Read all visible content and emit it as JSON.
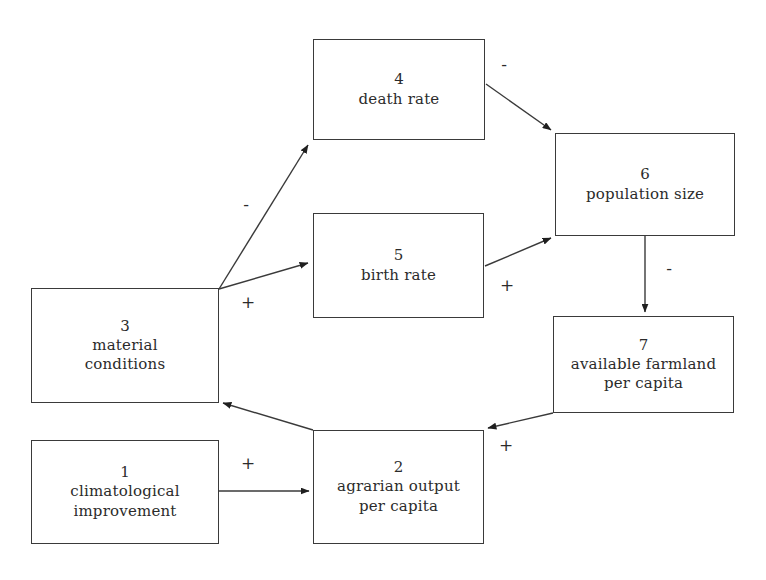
{
  "diagram": {
    "stroke_color": "#3a3a3a",
    "text_color": "#2b2b2b",
    "background_color": "#ffffff",
    "nodes": [
      {
        "key": "climatological-improvement",
        "id": "1",
        "label": "climatological\nimprovement",
        "x": 31,
        "y": 440,
        "w": 188,
        "h": 104
      },
      {
        "key": "agrarian-output-per-capita",
        "id": "2",
        "label": "agrarian output\nper capita",
        "x": 313,
        "y": 430,
        "w": 171,
        "h": 114
      },
      {
        "key": "material-conditions",
        "id": "3",
        "label": "material\nconditions",
        "x": 31,
        "y": 288,
        "w": 188,
        "h": 115
      },
      {
        "key": "death-rate",
        "id": "4",
        "label": "death rate",
        "x": 313,
        "y": 39,
        "w": 172,
        "h": 101
      },
      {
        "key": "birth-rate",
        "id": "5",
        "label": "birth rate",
        "x": 313,
        "y": 213,
        "w": 171,
        "h": 105
      },
      {
        "key": "population-size",
        "id": "6",
        "label": "population size",
        "x": 555,
        "y": 133,
        "w": 180,
        "h": 103
      },
      {
        "key": "available-farmland-per-capita",
        "id": "7",
        "label": "available farmland\nper capita",
        "x": 553,
        "y": 316,
        "w": 181,
        "h": 97
      }
    ],
    "edges": [
      {
        "key": "material-conditions-to-death-rate",
        "from": "3",
        "to": "4",
        "sign": "-",
        "sign_x": 238,
        "sign_y": 196,
        "path": "M 219 289 L 308 145"
      },
      {
        "key": "material-conditions-to-birth-rate",
        "from": "3",
        "to": "5",
        "sign": "+",
        "sign_x": 240,
        "sign_y": 294,
        "path": "M 219 289 L 308 263"
      },
      {
        "key": "death-rate-to-population-size",
        "from": "4",
        "to": "6",
        "sign": "-",
        "sign_x": 496,
        "sign_y": 56,
        "path": "M 486 84 L 551 130"
      },
      {
        "key": "birth-rate-to-population-size",
        "from": "5",
        "to": "6",
        "sign": "+",
        "sign_x": 499,
        "sign_y": 277,
        "path": "M 485 266 L 551 238"
      },
      {
        "key": "population-size-to-available-farmland",
        "from": "6",
        "to": "7",
        "sign": "-",
        "sign_x": 661,
        "sign_y": 260,
        "path": "M 645 236 L 645 312"
      },
      {
        "key": "available-farmland-to-agrarian-output",
        "from": "7",
        "to": "2",
        "sign": "+",
        "sign_x": 498,
        "sign_y": 437,
        "path": "M 553 413 L 488 428"
      },
      {
        "key": "agrarian-output-to-material-conditions",
        "from": "2",
        "to": "3",
        "sign": "",
        "sign_x": 0,
        "sign_y": 0,
        "path": "M 313 430 L 223 403"
      },
      {
        "key": "climatological-improvement-to-agrarian-output",
        "from": "1",
        "to": "2",
        "sign": "+",
        "sign_x": 240,
        "sign_y": 455,
        "path": "M 219 491 L 309 491"
      }
    ]
  }
}
